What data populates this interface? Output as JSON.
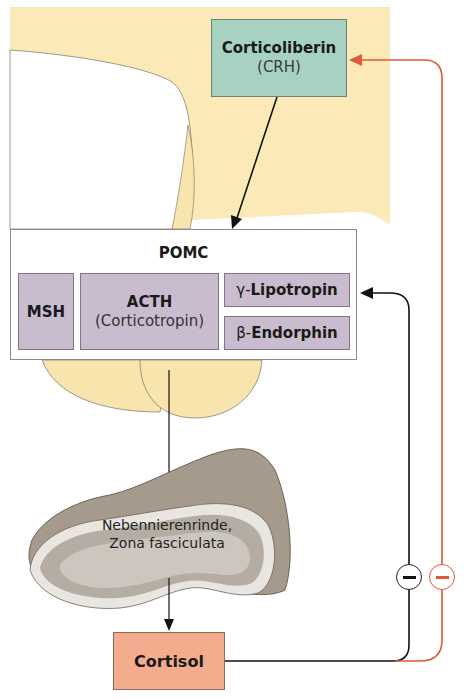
{
  "diagram": {
    "crh_box": {
      "name": "Corticoliberin",
      "abbr": "(CRH)",
      "color": "#a7d2c2"
    },
    "pomc_box": {
      "title": "POMC",
      "fragments": [
        {
          "label": "MSH"
        },
        {
          "label": "ACTH",
          "sublabel": "(Corticotropin)"
        },
        {
          "prefix": "γ-",
          "label": "Lipotropin"
        },
        {
          "prefix": "β-",
          "label": "Endorphin"
        }
      ],
      "fragment_color": "#c9bccf"
    },
    "adrenal": {
      "line1": "Nebennierenrinde,",
      "line2": "Zona fasciculata"
    },
    "cortisol_box": {
      "label": "Cortisol",
      "color": "#f3ad8e"
    },
    "feedback": [
      {
        "target": "POMC (pituitary)",
        "sign": "−",
        "color": "#111111"
      },
      {
        "target": "Corticoliberin (CRH)",
        "sign": "−",
        "color": "#e2583a"
      }
    ],
    "colors": {
      "hypothalamus": "#fbeab8",
      "pituitary": "#f8e4ad",
      "adrenal_outer": "#a69a8c",
      "adrenal_inner": "#c8c1b8"
    }
  }
}
